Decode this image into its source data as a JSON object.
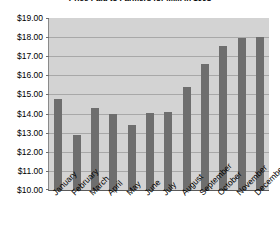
{
  "chart_data": {
    "type": "bar",
    "title": "Price Paid to Farmers for Milk in 1998",
    "xlabel": "",
    "ylabel": "",
    "categories": [
      "January",
      "February",
      "March",
      "April",
      "May",
      "June",
      "July",
      "August",
      "September",
      "October",
      "November",
      "December"
    ],
    "values": [
      14.75,
      12.9,
      14.3,
      14.0,
      13.4,
      14.05,
      14.1,
      15.4,
      16.6,
      17.55,
      17.95,
      18.0
    ],
    "ylim": [
      10.0,
      19.0
    ],
    "ytick_values": [
      19.0,
      18.0,
      17.0,
      16.0,
      15.0,
      14.0,
      13.0,
      12.0,
      11.0,
      10.0
    ],
    "ytick_labels": [
      "$19.00",
      "$18.00",
      "$17.00",
      "$16.00",
      "$15.00",
      "$14.00",
      "$13.00",
      "$12.00",
      "$11.00",
      "$10.00"
    ],
    "grid": true,
    "legend": false,
    "legend_position": "none",
    "series_name": "Price Paid",
    "colors": {
      "bar": "#6e6e6e",
      "plot_background": "#d3d3d3",
      "gridline": "#a8a8a8",
      "axis": "#5a5a5a",
      "text": "#000000",
      "page_background": "#ffffff"
    }
  }
}
